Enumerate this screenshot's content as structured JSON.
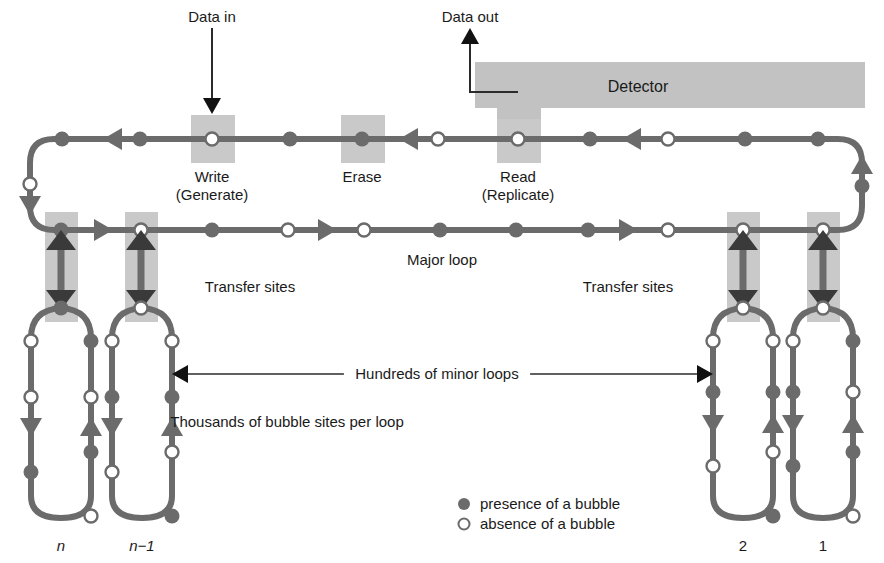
{
  "figure": {
    "type": "diagram",
    "background": "#ffffff",
    "colors": {
      "track": "#6b6b6b",
      "shade_box": "#c9c9c9",
      "detector_box": "#c2c2c2",
      "marker_fill": "#6b6b6b",
      "marker_open": "#ffffff",
      "text": "#1a1a1a",
      "thin_line": "#2b2b2b"
    }
  },
  "labels": {
    "data_in": "Data in",
    "data_out": "Data out",
    "detector": "Detector",
    "write_line1": "Write",
    "write_line2": "(Generate)",
    "erase": "Erase",
    "read_line1": "Read",
    "read_line2": "(Replicate)",
    "major_loop": "Major loop",
    "transfer_sites_left": "Transfer sites",
    "transfer_sites_right": "Transfer sites",
    "hundreds_minor_loops": "Hundreds of minor loops",
    "thousands_bubble_sites": "Thousands of bubble sites per loop",
    "loop_n": "n",
    "loop_n_minus_1": "n−1",
    "loop_2": "2",
    "loop_1": "1"
  },
  "legend": {
    "items": [
      {
        "marker": "filled",
        "text": "presence of a bubble"
      },
      {
        "marker": "open",
        "text": "absence of a bubble"
      }
    ]
  },
  "major_loop": {
    "description": "Closed rectangular major loop; propagation runs leftward along the top row, down the left side, rightward along the middle row, and up the right side.",
    "top_row_y": 139,
    "mid_row_y": 230,
    "left_x": 30,
    "right_x": 862,
    "top_row_markers": [
      {
        "x": 62,
        "type": "filled"
      },
      {
        "x": 113,
        "type": "arrow-left"
      },
      {
        "x": 140,
        "type": "filled"
      },
      {
        "x": 212,
        "type": "open",
        "station": "write"
      },
      {
        "x": 290,
        "type": "filled"
      },
      {
        "x": 362,
        "type": "filled",
        "station": "erase"
      },
      {
        "x": 409,
        "type": "arrow-left"
      },
      {
        "x": 438,
        "type": "open"
      },
      {
        "x": 518,
        "type": "open",
        "station": "read"
      },
      {
        "x": 590,
        "type": "filled"
      },
      {
        "x": 632,
        "type": "arrow-left"
      },
      {
        "x": 668,
        "type": "open"
      },
      {
        "x": 745,
        "type": "filled"
      },
      {
        "x": 818,
        "type": "filled"
      }
    ],
    "mid_row_markers": [
      {
        "x": 61,
        "type": "filled",
        "station": "transfer"
      },
      {
        "x": 103,
        "type": "arrow-right"
      },
      {
        "x": 141,
        "type": "open",
        "station": "transfer"
      },
      {
        "x": 212,
        "type": "filled"
      },
      {
        "x": 288,
        "type": "open"
      },
      {
        "x": 327,
        "type": "arrow-right"
      },
      {
        "x": 364,
        "type": "open"
      },
      {
        "x": 440,
        "type": "filled"
      },
      {
        "x": 516,
        "type": "filled"
      },
      {
        "x": 588,
        "type": "filled"
      },
      {
        "x": 628,
        "type": "arrow-right"
      },
      {
        "x": 668,
        "type": "open"
      },
      {
        "x": 743,
        "type": "open",
        "station": "transfer"
      },
      {
        "x": 823,
        "type": "open",
        "station": "transfer"
      }
    ],
    "left_side_markers": [
      {
        "y": 184,
        "type": "open"
      },
      {
        "y": 205,
        "type": "arrow-down"
      }
    ],
    "right_side_markers": [
      {
        "y": 165,
        "type": "arrow-up"
      },
      {
        "y": 186,
        "type": "filled"
      }
    ]
  },
  "stations": [
    {
      "name": "write",
      "box_x": 191,
      "box_y": 115,
      "box_w": 44,
      "box_h": 48,
      "cx": 212,
      "cy": 139,
      "marker": "open"
    },
    {
      "name": "erase",
      "box_x": 341,
      "box_y": 115,
      "box_w": 44,
      "box_h": 48,
      "cx": 362,
      "cy": 139,
      "marker": "filled"
    },
    {
      "name": "read",
      "box_x": 497,
      "box_y": 115,
      "box_w": 44,
      "box_h": 48,
      "cx": 518,
      "cy": 139,
      "marker": "open"
    }
  ],
  "detector_box": {
    "x": 475,
    "y": 62,
    "w": 390,
    "h": 46
  },
  "data_in_arrow": {
    "x": 212,
    "y_from": 28,
    "y_to": 112,
    "direction": "down"
  },
  "data_out_arrow": {
    "x": 470,
    "y_from": 92,
    "y_to": 28,
    "direction": "up",
    "elbow_x": 518
  },
  "transfer_sites": [
    {
      "id": "left-n",
      "box_x": 45,
      "box_y": 212,
      "box_w": 33,
      "box_h": 110,
      "cx": 61
    },
    {
      "id": "left-nm1",
      "box_x": 125,
      "box_y": 212,
      "box_w": 33,
      "box_h": 110,
      "cx": 141
    },
    {
      "id": "right-2",
      "box_x": 727,
      "box_y": 212,
      "box_w": 33,
      "box_h": 110,
      "cx": 743
    },
    {
      "id": "right-1",
      "box_x": 807,
      "box_y": 212,
      "box_w": 33,
      "box_h": 110,
      "cx": 823
    }
  ],
  "minor_loops": [
    {
      "id": "n",
      "label": "n",
      "left_x": 31,
      "right_x": 91,
      "top_y": 320,
      "bottom_y": 518,
      "label_y": 551,
      "top_marker": {
        "x": 61,
        "type": "filled"
      },
      "left_leg_markers": [
        {
          "y": 341,
          "type": "open"
        },
        {
          "y": 397,
          "type": "open"
        },
        {
          "y": 427,
          "type": "arrow-down"
        },
        {
          "y": 472,
          "type": "filled"
        }
      ],
      "right_leg_markers": [
        {
          "y": 341,
          "type": "filled"
        },
        {
          "y": 397,
          "type": "open"
        },
        {
          "y": 427,
          "type": "arrow-up"
        },
        {
          "y": 452,
          "type": "filled"
        },
        {
          "y": 516,
          "type": "open"
        }
      ]
    },
    {
      "id": "n-1",
      "label": "n−1",
      "left_x": 112,
      "right_x": 172,
      "top_y": 320,
      "bottom_y": 518,
      "label_y": 551,
      "top_marker": {
        "x": 141,
        "type": "open"
      },
      "left_leg_markers": [
        {
          "y": 341,
          "type": "open"
        },
        {
          "y": 397,
          "type": "filled"
        },
        {
          "y": 427,
          "type": "arrow-down"
        },
        {
          "y": 472,
          "type": "open"
        }
      ],
      "right_leg_markers": [
        {
          "y": 341,
          "type": "open"
        },
        {
          "y": 397,
          "type": "filled"
        },
        {
          "y": 427,
          "type": "arrow-up"
        },
        {
          "y": 452,
          "type": "open"
        },
        {
          "y": 516,
          "type": "filled"
        }
      ]
    },
    {
      "id": "2",
      "label": "2",
      "left_x": 713,
      "right_x": 773,
      "top_y": 320,
      "bottom_y": 518,
      "label_y": 551,
      "top_marker": {
        "x": 743,
        "type": "open"
      },
      "left_leg_markers": [
        {
          "y": 341,
          "type": "open"
        },
        {
          "y": 392,
          "type": "filled"
        },
        {
          "y": 424,
          "type": "arrow-down"
        },
        {
          "y": 466,
          "type": "open"
        }
      ],
      "right_leg_markers": [
        {
          "y": 341,
          "type": "open"
        },
        {
          "y": 392,
          "type": "filled"
        },
        {
          "y": 424,
          "type": "arrow-up"
        },
        {
          "y": 452,
          "type": "open"
        },
        {
          "y": 516,
          "type": "filled"
        }
      ]
    },
    {
      "id": "1",
      "label": "1",
      "left_x": 793,
      "right_x": 853,
      "top_y": 320,
      "bottom_y": 518,
      "label_y": 551,
      "top_marker": {
        "x": 823,
        "type": "open"
      },
      "left_leg_markers": [
        {
          "y": 341,
          "type": "open"
        },
        {
          "y": 392,
          "type": "filled"
        },
        {
          "y": 424,
          "type": "arrow-down"
        },
        {
          "y": 466,
          "type": "filled"
        }
      ],
      "right_leg_markers": [
        {
          "y": 341,
          "type": "filled"
        },
        {
          "y": 392,
          "type": "open"
        },
        {
          "y": 424,
          "type": "arrow-up"
        },
        {
          "y": 452,
          "type": "filled"
        },
        {
          "y": 516,
          "type": "open"
        }
      ]
    }
  ],
  "annotations": {
    "minor_loops_span": {
      "left_arrow_x": 172,
      "right_arrow_x": 713,
      "y": 374,
      "text_x": 437
    },
    "bubble_sites_text": {
      "x": 287,
      "y": 427
    }
  },
  "text_positions": {
    "data_in": {
      "x": 212,
      "y": 22,
      "anchor": "middle"
    },
    "data_out": {
      "x": 470,
      "y": 22,
      "anchor": "middle"
    },
    "detector": {
      "x": 638,
      "y": 92,
      "anchor": "middle"
    },
    "write_line1": {
      "x": 212,
      "y": 182,
      "anchor": "middle"
    },
    "write_line2": {
      "x": 212,
      "y": 200,
      "anchor": "middle"
    },
    "erase": {
      "x": 362,
      "y": 182,
      "anchor": "middle"
    },
    "read_line1": {
      "x": 518,
      "y": 182,
      "anchor": "middle"
    },
    "read_line2": {
      "x": 518,
      "y": 200,
      "anchor": "middle"
    },
    "major_loop": {
      "x": 442,
      "y": 265,
      "anchor": "middle"
    },
    "transfer_left": {
      "x": 250,
      "y": 292,
      "anchor": "middle"
    },
    "transfer_right": {
      "x": 628,
      "y": 292,
      "anchor": "middle"
    },
    "legend_x_marker": 464,
    "legend_x_text": 480,
    "legend_y1": 509,
    "legend_y2": 529
  }
}
